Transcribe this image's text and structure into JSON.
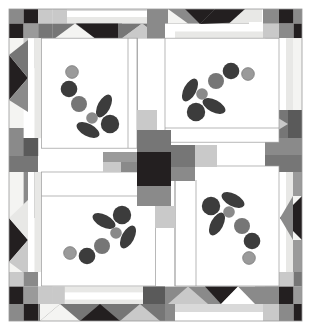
{
  "canvas": {
    "width": 311,
    "height": 330,
    "background": "#ffffff",
    "title": "Four-Block Appliqué Quilt Pattern Diagram"
  },
  "palette": {
    "white": "#ffffff",
    "offwhite": "#f4f4f2",
    "light_gray": "#d9d9d9",
    "pale_gray": "#c9c9c9",
    "mid_gray": "#9a9a9a",
    "medium_gray": "#8a8a8a",
    "slate_gray": "#767676",
    "dark_gray": "#5a5a5a",
    "charcoal": "#3c3c3c",
    "near_black": "#2b2b2b",
    "black": "#231f20",
    "outline": "#6b6b6b"
  },
  "layout": {
    "quilt_left": 9,
    "quilt_top": 9,
    "quilt_right": 302,
    "quilt_bottom": 321,
    "border_width": 29,
    "center_x": 155,
    "center_y": 165,
    "block_size": 86,
    "sashing_width": 22
  },
  "structure": {
    "name": "quilt-block-diagram",
    "block_count": 4,
    "blocks": [
      {
        "id": "block-top-left",
        "rotation": 0,
        "x": 47,
        "y": 47,
        "w": 89,
        "h": 89
      },
      {
        "id": "block-top-right",
        "rotation": 90,
        "x": 175,
        "y": 47,
        "w": 89,
        "h": 89
      },
      {
        "id": "block-bottom-left",
        "rotation": 270,
        "x": 47,
        "y": 194,
        "w": 89,
        "h": 89
      },
      {
        "id": "block-bottom-right",
        "rotation": 180,
        "x": 175,
        "y": 194,
        "w": 89,
        "h": 89
      }
    ],
    "appliqué_units": [
      {
        "type": "berry-large",
        "count": 3
      },
      {
        "type": "berry-medium",
        "count": 1
      },
      {
        "type": "berry-small",
        "count": 2
      },
      {
        "type": "leaf",
        "count": 2
      }
    ]
  },
  "motif": {
    "description": "Appliqué berry-and-leaf spray",
    "berries": [
      {
        "name": "berry-pale-top",
        "cx": 19,
        "cy": 14,
        "r": 6.4,
        "fill": "#9a9a9a"
      },
      {
        "name": "berry-dark-upper",
        "cx": 16,
        "cy": 31,
        "r": 8.3,
        "fill": "#3c3c3c"
      },
      {
        "name": "berry-mid-left",
        "cx": 26,
        "cy": 46,
        "r": 8.0,
        "fill": "#767676"
      },
      {
        "name": "berry-small-mid",
        "cx": 39,
        "cy": 60,
        "r": 5.8,
        "fill": "#8a8a8a"
      },
      {
        "name": "berry-dark-lower",
        "cx": 57,
        "cy": 66,
        "r": 9.2,
        "fill": "#3c3c3c"
      }
    ],
    "leaves": [
      {
        "name": "leaf-upper-right",
        "cx": 51,
        "cy": 48,
        "rx": 6.2,
        "ry": 12.5,
        "angle": 28,
        "fill": "#3c3c3c"
      },
      {
        "name": "leaf-lower-left",
        "cx": 35,
        "cy": 72,
        "rx": 6.2,
        "ry": 12.5,
        "angle": 118,
        "fill": "#3c3c3c"
      }
    ]
  },
  "border": {
    "description": "Pieced border with checkerboard corner squares, flying-geese triangles and narrow strips",
    "corner_checkerboard": {
      "rows": 3,
      "cols": 3,
      "cell": 14.6,
      "colors": [
        [
          "#8a8a8a",
          "#231f20",
          "#c9c9c9"
        ],
        [
          "#231f20",
          "#9a9a9a",
          "#767676"
        ],
        [
          "#f4f4f2",
          "#c9c9c9",
          "#ffffff"
        ]
      ]
    },
    "geese_triangles": [
      {
        "name": "goose-light",
        "fill": "#f4f4f2"
      },
      {
        "name": "goose-dark",
        "fill": "#231f20"
      },
      {
        "name": "goose-mid",
        "fill": "#c9c9c9"
      }
    ],
    "strips": [
      {
        "name": "strip-white",
        "fill": "#ffffff"
      },
      {
        "name": "strip-pale",
        "fill": "#e8e8e6"
      },
      {
        "name": "strip-gray",
        "fill": "#8a8a8a"
      }
    ]
  },
  "center": {
    "name": "center-four-patch",
    "square_fill": "#231f20",
    "arms": [
      {
        "name": "center-arm-top",
        "fill": "#767676"
      },
      {
        "name": "center-arm-right",
        "fill": "#767676"
      },
      {
        "name": "center-arm-bottom",
        "fill": "#8a8a8a"
      },
      {
        "name": "center-arm-left",
        "fill": "#8a8a8a"
      }
    ],
    "accents": [
      {
        "name": "center-accent-upper",
        "fill": "#c9c9c9"
      },
      {
        "name": "center-accent-lower",
        "fill": "#c9c9c9"
      }
    ]
  }
}
